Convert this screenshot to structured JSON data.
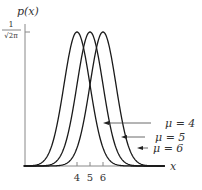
{
  "chart_data": {
    "type": "line",
    "title": "",
    "xlabel": "x",
    "ylabel": "p(x)",
    "y_tick_labels": [
      "1/√(2π)"
    ],
    "x_tick_labels": [
      "4",
      "5",
      "6"
    ],
    "x_ticks": [
      4,
      5,
      6
    ],
    "xlim": [
      -0.1,
      10.8
    ],
    "ylim": [
      0,
      0.399
    ],
    "grid": false,
    "legend_position": "inline-annotations-right",
    "series": [
      {
        "name": "μ = 4",
        "mu": 4,
        "sigma": 1,
        "peak": 0.399
      },
      {
        "name": "μ = 5",
        "mu": 5,
        "sigma": 1,
        "peak": 0.399
      },
      {
        "name": "μ = 6",
        "mu": 6,
        "sigma": 1,
        "peak": 0.399
      }
    ],
    "annotations": [
      {
        "text": "μ = 4",
        "arrow_to_series": "μ = 4"
      },
      {
        "text": "μ = 5",
        "arrow_to_series": "μ = 5"
      },
      {
        "text": "μ = 6",
        "arrow_to_series": "μ = 6"
      }
    ]
  },
  "labels": {
    "ylabel": "p(x)",
    "ytick_num": "1",
    "ytick_den": "√2π",
    "xlabel": "x",
    "xtick_4": "4",
    "xtick_5": "5",
    "xtick_6": "6",
    "ann_mu4": "μ = 4",
    "ann_mu5": "μ = 5",
    "ann_mu6": "μ = 6"
  },
  "colors": {
    "curve": "#1a1a1a",
    "axis": "#888888",
    "text": "#333333"
  }
}
